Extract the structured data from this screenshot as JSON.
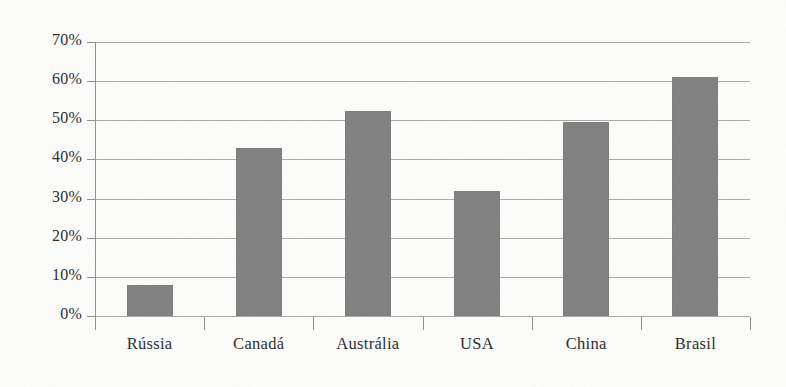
{
  "chart_data": {
    "type": "bar",
    "title": "",
    "subtitle": "",
    "xlabel": "",
    "ylabel": "",
    "categories": [
      "Rússia",
      "Canadá",
      "Austrália",
      "USA",
      "China",
      "Brasil"
    ],
    "values": [
      8,
      43,
      52.5,
      32,
      49.5,
      61
    ],
    "value_unit": "%",
    "ylim": [
      0,
      70
    ],
    "ytick_labels": [
      "0%",
      "10%",
      "20%",
      "30%",
      "40%",
      "50%",
      "60%",
      "70%"
    ],
    "ytick_values": [
      0,
      10,
      20,
      30,
      40,
      50,
      60,
      70
    ],
    "grid": true,
    "legend": false,
    "legend_position": "none",
    "series": [
      {
        "name": "",
        "values": [
          8,
          43,
          52.5,
          32,
          49.5,
          61
        ]
      }
    ],
    "colors": {
      "bar_fill": "#808080",
      "gridline": "#9a9a96",
      "axis": "#8f8f8b",
      "text": "#2b2b2b",
      "background": "#fdfdfb"
    }
  }
}
